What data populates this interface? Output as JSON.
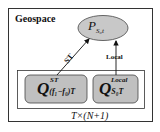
{
  "diagram": {
    "outer_label": "Geospace",
    "target_node": {
      "symbol": "P",
      "subscript": "S₀t",
      "fill": "#c8c8c8"
    },
    "source_nodes": [
      {
        "id": "st",
        "symbol": "Q",
        "superscript": "ST",
        "subscript": "(f₁−f₀)T",
        "fill": "#c0c0c0"
      },
      {
        "id": "local",
        "symbol": "Q",
        "superscript": "Local",
        "subscript": "S₀T",
        "fill": "#c0c0c0"
      }
    ],
    "edges": [
      {
        "from": "st",
        "to": "target",
        "label": "ST"
      },
      {
        "from": "local",
        "to": "target",
        "label": "Local"
      }
    ],
    "group_label": "T×(N+1)",
    "colors": {
      "stroke": "#333333",
      "node_fill": "#c4c4c4",
      "background": "#ffffff"
    }
  }
}
